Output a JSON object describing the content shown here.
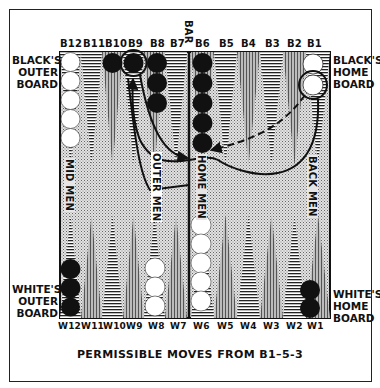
{
  "caption": "PERMISSIBLE MOVES FROM B1–5-3",
  "bar_label": "BAR",
  "top_points": [
    "B12",
    "B11",
    "B10",
    "B9",
    "B8",
    "B7",
    "B6",
    "B5",
    "B4",
    "B3",
    "B2",
    "B1"
  ],
  "bottom_points": [
    "W12",
    "W11",
    "W10",
    "W9",
    "W8",
    "W7",
    "W6",
    "W5",
    "W4",
    "W3",
    "W2",
    "W1"
  ],
  "side_labels": {
    "black_outer": [
      "BLACK'S",
      "OUTER",
      "BOARD"
    ],
    "black_home": [
      "BLACK'S",
      "HOME",
      "BOARD"
    ],
    "white_outer": [
      "WHITE'S",
      "OUTER",
      "BOARD"
    ],
    "white_home": [
      "WHITE'S",
      "HOME",
      "BOARD"
    ]
  },
  "vertical_labels": {
    "mid_men": "MID MEN",
    "outer_men": "OUTER MEN",
    "home_men": "HOME MEN",
    "back_men": "BACK MEN"
  },
  "checkers": {
    "B12": {
      "color": "white",
      "count": 5
    },
    "B10": {
      "color": "black",
      "count": 1
    },
    "B9": {
      "color": "black",
      "count": 1,
      "circled": true
    },
    "B8": {
      "color": "black",
      "count": 3
    },
    "B6": {
      "color": "black",
      "count": 5
    },
    "B1": {
      "color": "white",
      "count": 2,
      "circled": true
    },
    "W12": {
      "color": "black",
      "count": 3
    },
    "W8": {
      "color": "white",
      "count": 3
    },
    "W6": {
      "color": "white",
      "count": 5
    },
    "W1": {
      "color": "black",
      "count": 2
    }
  },
  "moves": [
    {
      "from": "B1",
      "to": "B9",
      "style": "solid"
    },
    {
      "from": "B1",
      "to": "B6",
      "style": "dashed"
    },
    {
      "from": "B9",
      "to": "B6",
      "style": "solid"
    }
  ],
  "colors": {
    "ink": "#111111",
    "paper": "#ffffff",
    "stipple": "#b9b9b9"
  }
}
